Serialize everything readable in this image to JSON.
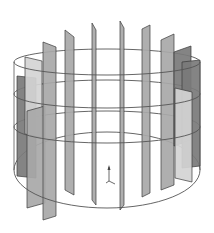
{
  "diagram": {
    "type": "3d-cylinder-baffles",
    "colors": {
      "background": "#ffffff",
      "ring": "#555555",
      "plate_light": "#d4d4d4",
      "plate_mid": "#a8a8a8",
      "plate_dark": "#7a7a7a",
      "plate_edge": "#3a3a3a",
      "axis": "#444444"
    },
    "rings": [
      {
        "name": "ring-top",
        "cx": 107,
        "cy": 62,
        "rx": 93,
        "ry": 13
      },
      {
        "name": "ring-upper-middle",
        "cx": 107,
        "cy": 94,
        "rx": 93,
        "ry": 14
      },
      {
        "name": "ring-lower-middle",
        "cx": 107,
        "cy": 127,
        "rx": 93,
        "ry": 16
      },
      {
        "name": "ring-bottom",
        "cx": 107,
        "cy": 170,
        "rx": 93,
        "ry": 38
      }
    ],
    "plates": [
      {
        "name": "plate-left-outer-dark",
        "points": "17,76 36,78 36,178 17,176",
        "shade": "dark"
      },
      {
        "name": "plate-left-light-back",
        "points": "25,57 42,61 42,138 25,134",
        "shade": "light"
      },
      {
        "name": "plate-left-front-mid",
        "points": "27,111 45,106 45,203 27,208",
        "shade": "mid"
      },
      {
        "name": "plate-left-front-tall",
        "points": "43,42 56,47 56,216 43,220",
        "shade": "mid"
      },
      {
        "name": "plate-left-inner",
        "points": "65,30 74,37 74,195 65,190",
        "shade": "mid"
      },
      {
        "name": "plate-center-left",
        "points": "92,23 96,30 96,205 92,200",
        "shade": "mid"
      },
      {
        "name": "plate-center-right",
        "points": "120,21 124,28 124,205 120,210",
        "shade": "mid"
      },
      {
        "name": "plate-right-inner",
        "points": "142,29 150,25 150,193 142,197",
        "shade": "mid"
      },
      {
        "name": "plate-right-mid",
        "points": "161,40 174,34 174,185 161,190",
        "shade": "mid"
      },
      {
        "name": "plate-right-dark",
        "points": "174,52 191,46 191,140 174,146",
        "shade": "dark"
      },
      {
        "name": "plate-right-outer-dark",
        "points": "182,62 200,60 200,166 182,168",
        "shade": "dark"
      },
      {
        "name": "plate-right-light-front",
        "points": "175,88 192,92 192,182 175,178",
        "shade": "light"
      }
    ],
    "axis_triad": {
      "x": 109,
      "y": 181,
      "labels": [
        "z",
        "x",
        "y"
      ]
    }
  }
}
